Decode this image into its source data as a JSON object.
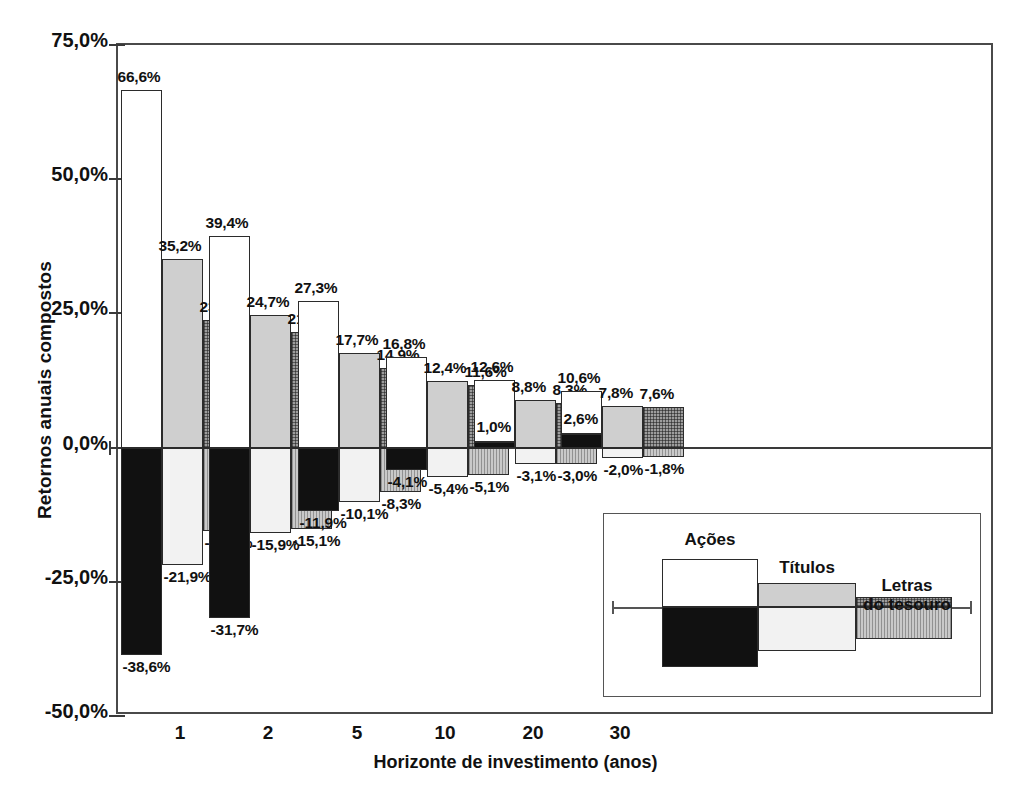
{
  "chart_data": {
    "type": "bar",
    "title": "",
    "subtitle": "",
    "xlabel": "Horizonte de investimento (anos)",
    "ylabel": "Retornos anuais compostos",
    "categories": [
      "1",
      "2",
      "5",
      "10",
      "20",
      "30"
    ],
    "ylim": [
      -50.0,
      75.0
    ],
    "ytick_values": [
      75.0,
      50.0,
      25.0,
      0.0,
      -25.0,
      -50.0
    ],
    "ytick_labels": [
      "75,0%",
      "50,0%",
      "25,0%",
      "0,0%",
      "-25,0%",
      "-50,0%"
    ],
    "grid": false,
    "legend_position": "inset-bottom-right",
    "value_format": "comma-decimal-percent",
    "series": [
      {
        "name": "Ações",
        "fill_high": "white",
        "fill_low": "black",
        "max_values": [
          66.6,
          39.4,
          27.3,
          16.8,
          12.6,
          10.6
        ],
        "min_values": [
          -38.6,
          -31.7,
          -11.9,
          -4.1,
          1.0,
          2.6
        ],
        "max_labels": [
          "66,6%",
          "39,4%",
          "27,3%",
          "16,8%",
          "12,6%",
          "10,6%"
        ],
        "min_labels": [
          "-38,6%",
          "-31,7%",
          "-11,9%",
          "-4,1%",
          "1,0%",
          "2,6%"
        ]
      },
      {
        "name": "Títulos",
        "fill_high": "light-gray",
        "fill_low": "very-light-gray",
        "max_values": [
          35.2,
          24.7,
          17.7,
          12.4,
          8.8,
          7.8
        ],
        "min_values": [
          -21.9,
          -15.9,
          -10.1,
          -5.4,
          -3.1,
          -2.0
        ],
        "max_labels": [
          "35,2%",
          "24,7%",
          "17,7%",
          "12,4%",
          "8,8%",
          "7,8%"
        ],
        "min_labels": [
          "-21,9%",
          "-15,9%",
          "-10,1%",
          "-5,4%",
          "-3,1%",
          "-2,0%"
        ]
      },
      {
        "name": "Letras do tesouro",
        "fill_high": "dark-hatch",
        "fill_low": "vertical-stripe-gray",
        "max_values": [
          23.7,
          21.6,
          14.9,
          11.6,
          8.3,
          7.6
        ],
        "min_values": [
          -15.6,
          -15.1,
          -8.3,
          -5.1,
          -3.0,
          -1.8
        ],
        "max_labels": [
          "23,7%",
          "21,6%",
          "14,9%",
          "11,6%",
          "8,3%",
          "7,6%"
        ],
        "min_labels": [
          "-15,6%",
          "-15,1%",
          "-8,3%",
          "-5,1%",
          "-3,0%",
          "-1,8%"
        ]
      }
    ]
  },
  "legend": {
    "items": [
      {
        "label": "Ações",
        "label_line2": ""
      },
      {
        "label": "Títulos",
        "label_line2": ""
      },
      {
        "label": "Letras",
        "label_line2": "do tesouro"
      }
    ]
  },
  "colors": {
    "acoes_high": "#ffffff",
    "acoes_low": "#111111",
    "titulos_high": "#cfcfcf",
    "titulos_low": "#f2f2f2",
    "letras_high": "#9d9d9d",
    "letras_low": "#c9c9c9",
    "axis": "#3a3a3a",
    "outline": "#2b2b2b"
  }
}
